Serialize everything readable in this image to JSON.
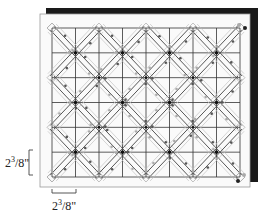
{
  "diagram": {
    "type": "quilting-layout",
    "grid": {
      "columns": 8,
      "rows": 6
    },
    "colors": {
      "shadow": "#1a1a1a",
      "paper": "#ffffff",
      "paper_border": "#888888",
      "grid_line": "#333333",
      "diagonal_line": "#444444",
      "arrow_light": "#aaaaaa",
      "arrow_dark": "#555555",
      "dot": "#111111",
      "dot_light": "#999999"
    }
  },
  "dimensions": {
    "vertical": {
      "whole": "2",
      "fraction_num": "3",
      "fraction_den": "8",
      "unit": "\"",
      "text": "2³/8\""
    },
    "horizontal": {
      "whole": "2",
      "fraction_num": "3",
      "fraction_den": "8",
      "unit": "\"",
      "text": "2³/8\""
    }
  }
}
